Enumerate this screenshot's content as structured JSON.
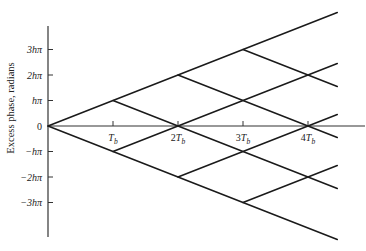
{
  "chart_data": {
    "type": "line",
    "title": "",
    "xlabel": "",
    "ylabel": "Excess phase, radians",
    "x_ticks": [
      "T_b",
      "2T_b",
      "3T_b",
      "4T_b"
    ],
    "x_tick_values": [
      1,
      2,
      3,
      4
    ],
    "y_ticks": [
      "3hπ",
      "2hπ",
      "hπ",
      "0",
      "−hπ",
      "−2hπ",
      "−3hπ"
    ],
    "y_tick_values": [
      3,
      2,
      1,
      0,
      -1,
      -2,
      -3
    ],
    "xlim": [
      0,
      4.45
    ],
    "ylim": [
      -4.45,
      4.45
    ],
    "grid": false,
    "legend": null,
    "series": [
      {
        "name": "upper-envelope",
        "points": [
          [
            0,
            0
          ],
          [
            4.45,
            4.45
          ]
        ]
      },
      {
        "name": "lower-envelope",
        "points": [
          [
            0,
            0
          ],
          [
            4.45,
            -4.45
          ]
        ]
      },
      {
        "name": "branch-from-1-hpi-down",
        "points": [
          [
            1,
            1
          ],
          [
            4.45,
            -2.45
          ]
        ]
      },
      {
        "name": "branch-from-neg1-hpi-up",
        "points": [
          [
            1,
            -1
          ],
          [
            4.45,
            2.45
          ]
        ]
      },
      {
        "name": "branch-from-2-hpi-down",
        "points": [
          [
            2,
            2
          ],
          [
            4.45,
            -0.45
          ]
        ]
      },
      {
        "name": "branch-from-neg2-hpi-up",
        "points": [
          [
            2,
            -2
          ],
          [
            4.45,
            0.45
          ]
        ]
      },
      {
        "name": "branch-from-3-hpi-down",
        "points": [
          [
            3,
            3
          ],
          [
            4.45,
            1.55
          ]
        ]
      },
      {
        "name": "branch-from-neg3-hpi-up",
        "points": [
          [
            3,
            -3
          ],
          [
            4.45,
            -1.55
          ]
        ]
      }
    ]
  },
  "axes": {
    "y_title": "Excess phase, radians",
    "x_ticks": [
      {
        "label": "T",
        "sub": "b",
        "prefix": ""
      },
      {
        "label": "T",
        "sub": "b",
        "prefix": "2"
      },
      {
        "label": "T",
        "sub": "b",
        "prefix": "3"
      },
      {
        "label": "T",
        "sub": "b",
        "prefix": "4"
      }
    ],
    "y_ticks": [
      "3hπ",
      "2hπ",
      "hπ",
      "0",
      "−hπ",
      "−2hπ",
      "−3hπ"
    ]
  },
  "colors": {
    "line": "#1a1a1a",
    "axis": "#333333",
    "text": "#222222",
    "background": "#ffffff"
  }
}
